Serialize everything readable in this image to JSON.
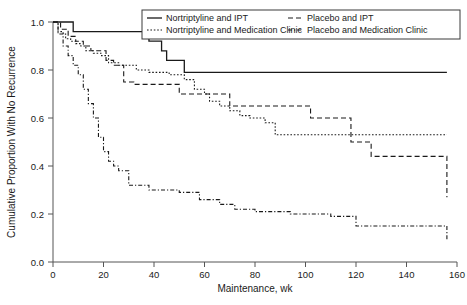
{
  "chart_data": {
    "type": "line",
    "title": "",
    "xlabel": "Maintenance, wk",
    "ylabel": "Cumulative Proportion With No Recurrence",
    "xlim": [
      0,
      160
    ],
    "ylim": [
      0.0,
      1.0
    ],
    "xticks": [
      0,
      20,
      40,
      60,
      80,
      100,
      120,
      140,
      160
    ],
    "xtick_labels": [
      "0",
      "20",
      "40",
      "60",
      "80",
      "100",
      "120",
      "140",
      "160"
    ],
    "yticks": [
      0.0,
      0.2,
      0.4,
      0.6,
      0.8,
      1.0
    ],
    "ytick_labels": [
      "0.0",
      "0.2",
      "0.4",
      "0.6",
      "0.8",
      "1.0"
    ],
    "grid": false,
    "legend_position": "top-right",
    "step_style": "post",
    "series": [
      {
        "name": "Nortriptyline and IPT",
        "line_style": "solid",
        "color": "#1a1a1a",
        "x": [
          0,
          3,
          8,
          30,
          38,
          43,
          45,
          52,
          156
        ],
        "y": [
          1.0,
          1.0,
          0.96,
          0.96,
          0.92,
          0.88,
          0.84,
          0.79,
          0.79
        ]
      },
      {
        "name": "Nortriptyline and Medication Clinic",
        "line_style": "dotted",
        "color": "#1a1a1a",
        "x": [
          0,
          2,
          4,
          5,
          7,
          9,
          11,
          13,
          16,
          19,
          22,
          26,
          29,
          33,
          38,
          46,
          52,
          56,
          60,
          62,
          66,
          70,
          74,
          78,
          84,
          88,
          156
        ],
        "y": [
          1.0,
          0.96,
          0.95,
          0.93,
          0.92,
          0.91,
          0.9,
          0.88,
          0.87,
          0.86,
          0.83,
          0.82,
          0.82,
          0.8,
          0.79,
          0.78,
          0.76,
          0.72,
          0.7,
          0.67,
          0.65,
          0.63,
          0.61,
          0.6,
          0.58,
          0.53,
          0.53
        ]
      },
      {
        "name": "Placebo and IPT",
        "line_style": "dashed",
        "color": "#1a1a1a",
        "x": [
          0,
          3,
          6,
          9,
          12,
          15,
          18,
          21,
          24,
          28,
          32,
          42,
          50,
          54,
          58,
          62,
          66,
          70,
          86,
          102,
          118,
          126,
          140,
          156
        ],
        "y": [
          1.0,
          0.97,
          0.94,
          0.92,
          0.9,
          0.88,
          0.88,
          0.84,
          0.82,
          0.75,
          0.74,
          0.74,
          0.7,
          0.7,
          0.7,
          0.7,
          0.7,
          0.65,
          0.65,
          0.6,
          0.5,
          0.44,
          0.44,
          0.27
        ]
      },
      {
        "name": "Placebo and Medication Clinic",
        "line_style": "dashdot",
        "color": "#1a1a1a",
        "x": [
          0,
          2,
          4,
          6,
          8,
          10,
          12,
          14,
          16,
          18,
          20,
          22,
          24,
          26,
          30,
          34,
          38,
          44,
          50,
          58,
          66,
          72,
          80,
          94,
          110,
          120,
          150,
          156
        ],
        "y": [
          1.0,
          0.95,
          0.9,
          0.86,
          0.82,
          0.78,
          0.72,
          0.66,
          0.6,
          0.52,
          0.46,
          0.42,
          0.4,
          0.38,
          0.32,
          0.32,
          0.3,
          0.3,
          0.29,
          0.26,
          0.24,
          0.22,
          0.21,
          0.2,
          0.19,
          0.15,
          0.15,
          0.09
        ]
      }
    ]
  },
  "legend": {
    "entries": [
      {
        "label": "Nortriptyline and IPT",
        "style": "solid"
      },
      {
        "label": "Placebo and IPT",
        "style": "dashed"
      },
      {
        "label": "Nortriptyline and Medication Clinic",
        "style": "dotted"
      },
      {
        "label": "Placebo and Medication Clinic",
        "style": "dashdot"
      }
    ]
  },
  "caption": {
    "text": ""
  }
}
